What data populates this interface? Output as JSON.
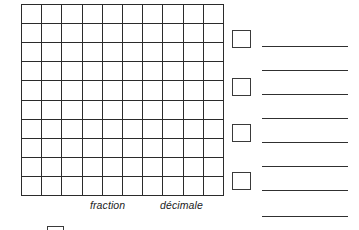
{
  "document": {
    "type": "math-worksheet",
    "language": "fr",
    "title": "",
    "background_color": "#ffffff",
    "ink_color": "#2b2b2b"
  },
  "grid": {
    "name": "hundred-square-grid",
    "columns": 10,
    "rows": 10,
    "total_cells": 100,
    "shaded_cells": 0,
    "cell_fill": "#ffffff",
    "line_color": "#2b2b2b",
    "left": 21,
    "top": 4,
    "width": 203,
    "height": 192
  },
  "captions": [
    {
      "id": "fraction",
      "text": "fraction",
      "left": 90,
      "top": 199
    },
    {
      "id": "decimale",
      "text": "décimale",
      "left": 160,
      "top": 199
    }
  ],
  "checkboxes": [
    {
      "id": "checkbox-1",
      "label": "",
      "checked": false,
      "left": 232,
      "top": 30
    },
    {
      "id": "checkbox-2",
      "label": "",
      "checked": false,
      "left": 232,
      "top": 78
    },
    {
      "id": "checkbox-3",
      "label": "",
      "checked": false,
      "left": 232,
      "top": 124
    },
    {
      "id": "checkbox-4",
      "label": "",
      "checked": false,
      "left": 232,
      "top": 172
    }
  ],
  "answer_lines": [
    {
      "id": "answer-line-1",
      "value": "",
      "left": 262,
      "top": 46,
      "width": 86
    },
    {
      "id": "answer-line-2",
      "value": "",
      "left": 262,
      "top": 70,
      "width": 86
    },
    {
      "id": "answer-line-3",
      "value": "",
      "left": 262,
      "top": 94,
      "width": 86
    },
    {
      "id": "answer-line-4",
      "value": "",
      "left": 262,
      "top": 118,
      "width": 86
    },
    {
      "id": "answer-line-5",
      "value": "",
      "left": 262,
      "top": 142,
      "width": 86
    },
    {
      "id": "answer-line-6",
      "value": "",
      "left": 262,
      "top": 166,
      "width": 86
    },
    {
      "id": "answer-line-7",
      "value": "",
      "left": 262,
      "top": 190,
      "width": 86
    },
    {
      "id": "answer-line-8",
      "value": "",
      "left": 262,
      "top": 216,
      "width": 86
    }
  ],
  "bottom_partial_box": {
    "id": "partial-box-next-item",
    "checked": false,
    "left": 47,
    "top": 226
  }
}
